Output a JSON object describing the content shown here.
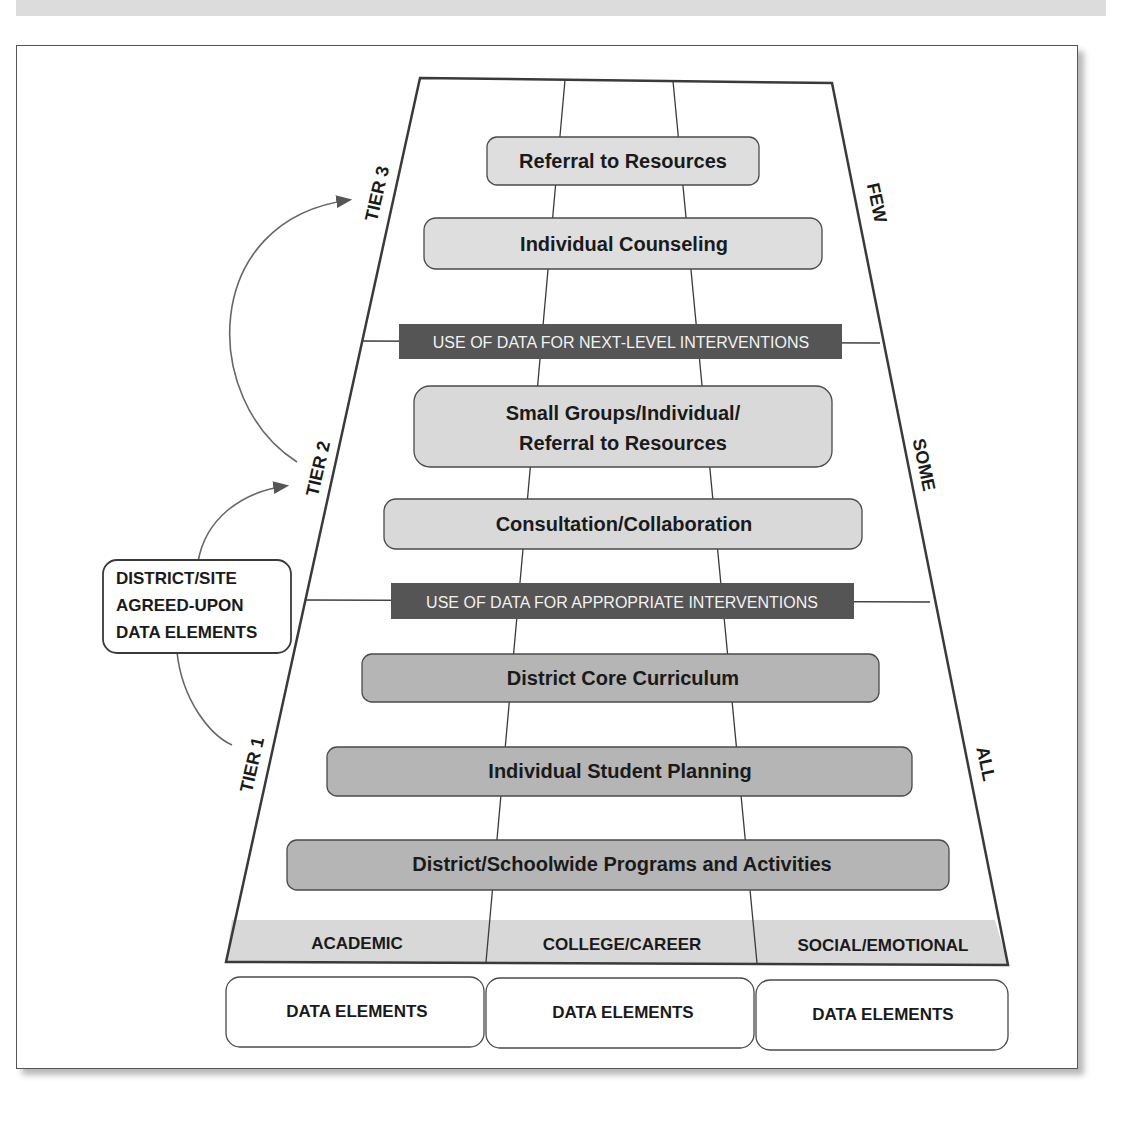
{
  "tiers": {
    "tier3": "TIER 3",
    "tier2": "TIER 2",
    "tier1": "TIER 1"
  },
  "reach": {
    "few": "FEW",
    "some": "SOME",
    "all": "ALL"
  },
  "callout": {
    "line1": "DISTRICT/SITE",
    "line2": "AGREED-UPON",
    "line3": "DATA ELEMENTS"
  },
  "interventions": [
    {
      "label": "Referral to Resources",
      "tier": 3
    },
    {
      "label": "Individual Counseling",
      "tier": 3
    },
    {
      "label_line1": "Small Groups/Individual/",
      "label_line2": "Referral to Resources",
      "tier": 2
    },
    {
      "label": "Consultation/Collaboration",
      "tier": 2
    },
    {
      "label": "District Core Curriculum",
      "tier": 1
    },
    {
      "label": "Individual Student Planning",
      "tier": 1
    },
    {
      "label": "District/Schoolwide Programs and Activities",
      "tier": 1
    }
  ],
  "data_bands": {
    "next_level": "USE OF DATA FOR NEXT-LEVEL INTERVENTIONS",
    "appropriate": "USE OF DATA FOR APPROPRIATE INTERVENTIONS"
  },
  "domains": [
    "ACADEMIC",
    "COLLEGE/CAREER",
    "SOCIAL/EMOTIONAL"
  ],
  "data_elements": [
    "DATA ELEMENTS",
    "DATA ELEMENTS",
    "DATA ELEMENTS"
  ],
  "colors": {
    "tier3_box": "#dedede",
    "tier2_box": "#d9d9d9",
    "tier1_box": "#b5b5b5",
    "band": "#555555",
    "domain_strip": "#d8d8d8",
    "line": "#3a3a3a"
  }
}
